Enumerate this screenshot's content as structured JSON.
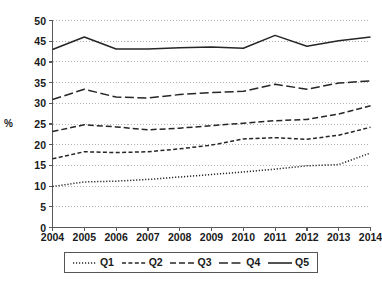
{
  "chart_data": {
    "type": "line",
    "title": "",
    "xlabel": "",
    "ylabel": "%",
    "ylim": [
      0,
      50
    ],
    "ytick_step": 5,
    "yticks": [
      "50",
      "45",
      "40",
      "35",
      "30",
      "25",
      "20",
      "15",
      "10",
      "5",
      "0"
    ],
    "grid": true,
    "grid_style": "dotted-horizontal",
    "legend_position": "bottom",
    "categories": [
      "2004",
      "2005",
      "2006",
      "2007",
      "2008",
      "2009",
      "2010",
      "2011",
      "2012",
      "2013",
      "2014"
    ],
    "x": [
      2004,
      2005,
      2006,
      2007,
      2008,
      2009,
      2010,
      2011,
      2012,
      2013,
      2014
    ],
    "series": [
      {
        "name": "Q1",
        "dash": "dotted",
        "values": [
          9.9,
          11.0,
          11.2,
          11.6,
          12.2,
          12.8,
          13.4,
          14.1,
          14.9,
          15.2,
          18.0
        ]
      },
      {
        "name": "Q2",
        "dash": "short-dash",
        "values": [
          16.6,
          18.3,
          18.1,
          18.3,
          19.0,
          19.9,
          21.4,
          21.7,
          21.3,
          22.3,
          24.2
        ]
      },
      {
        "name": "Q3",
        "dash": "medium-dash",
        "values": [
          23.2,
          24.8,
          24.3,
          23.6,
          24.0,
          24.6,
          25.2,
          25.8,
          26.1,
          27.4,
          29.4
        ]
      },
      {
        "name": "Q4",
        "dash": "long-dash",
        "values": [
          30.9,
          33.4,
          31.5,
          31.3,
          32.1,
          32.6,
          32.9,
          34.6,
          33.4,
          34.9,
          35.4
        ]
      },
      {
        "name": "Q5",
        "dash": "solid",
        "values": [
          43.0,
          46.0,
          43.1,
          43.1,
          43.4,
          43.6,
          43.3,
          46.4,
          43.8,
          45.1,
          46.0
        ]
      }
    ],
    "colors": {
      "line": "#262626",
      "grid": "#b3b3b3",
      "axis": "#595959",
      "background": "#ffffff"
    }
  },
  "legend": {
    "items": [
      {
        "label": "Q1"
      },
      {
        "label": "Q2"
      },
      {
        "label": "Q3"
      },
      {
        "label": "Q4"
      },
      {
        "label": "Q5"
      }
    ]
  }
}
